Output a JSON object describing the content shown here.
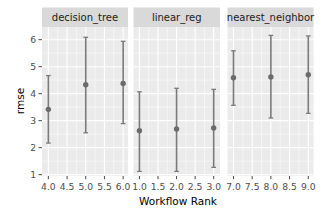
{
  "chart_data": {
    "type": "scatter",
    "subtype": "faceted point-range (mean ± error bars)",
    "title": "",
    "xlabel": "Workflow Rank",
    "ylabel": "rmse",
    "ylim": [
      0.95,
      6.47
    ],
    "yticks": [
      1,
      2,
      3,
      4,
      5,
      6
    ],
    "grid": true,
    "legend": null,
    "facets": [
      {
        "label": "decision_tree",
        "xlim": [
          3.83,
          6.13
        ],
        "xticks": [
          "4.0",
          "4.5",
          "5.0",
          "5.5",
          "6.0"
        ],
        "points": [
          {
            "x": 4,
            "y": 3.42,
            "ymin": 2.17,
            "ymax": 4.67
          },
          {
            "x": 5,
            "y": 4.33,
            "ymin": 2.55,
            "ymax": 6.09
          },
          {
            "x": 6,
            "y": 4.38,
            "ymin": 2.89,
            "ymax": 5.94
          }
        ]
      },
      {
        "label": "linear_reg",
        "xlim": [
          0.84,
          3.17
        ],
        "xticks": [
          "1.0",
          "1.5",
          "2.0",
          "2.5",
          "3.0"
        ],
        "points": [
          {
            "x": 1,
            "y": 2.63,
            "ymin": 1.12,
            "ymax": 4.07
          },
          {
            "x": 2,
            "y": 2.69,
            "ymin": 1.12,
            "ymax": 4.2
          },
          {
            "x": 3,
            "y": 2.73,
            "ymin": 1.27,
            "ymax": 4.16
          }
        ]
      },
      {
        "label": "nearest_neighbor",
        "xlim": [
          6.84,
          9.14
        ],
        "xticks": [
          "7.0",
          "7.5",
          "8.0",
          "8.5",
          "9.0"
        ],
        "points": [
          {
            "x": 7,
            "y": 4.59,
            "ymin": 3.57,
            "ymax": 5.59
          },
          {
            "x": 8,
            "y": 4.62,
            "ymin": 3.1,
            "ymax": 6.16
          },
          {
            "x": 9,
            "y": 4.7,
            "ymin": 3.27,
            "ymax": 6.14
          }
        ]
      }
    ]
  },
  "colors": {
    "panel_bg": "#ebebeb",
    "strip_bg": "#d9d9d9",
    "grid": "#ffffff",
    "point": "#6b6b6b",
    "errorbar": "#7a7a7a",
    "tick": "#4d4d4d"
  }
}
